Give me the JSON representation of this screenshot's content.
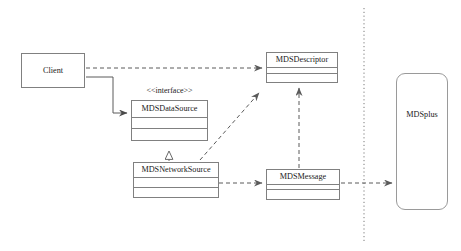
{
  "diagram": {
    "background_color": "#ffffff",
    "line_color": "#808080",
    "text_color": "#1a1a1a",
    "boundary_line_color": "#8a8a8a"
  },
  "nodes": {
    "client": {
      "label": "Client",
      "kind": "plain-box",
      "x": 21,
      "y": 53,
      "w": 64,
      "h": 35
    },
    "mds_data_source": {
      "label": "MDSDataSource",
      "stereotype": "<<interface>>",
      "kind": "uml-class",
      "x": 131,
      "y": 100,
      "w": 77,
      "h": 41,
      "stereotype_x": 131,
      "stereotype_y": 88,
      "stereotype_w": 77
    },
    "mds_network_source": {
      "label": "MDSNetworkSource",
      "kind": "uml-class",
      "x": 133,
      "y": 162,
      "w": 86,
      "h": 36
    },
    "mds_descriptor": {
      "label": "MDSDescriptor",
      "kind": "uml-class",
      "x": 266,
      "y": 52,
      "w": 72,
      "h": 31
    },
    "mds_message": {
      "label": "MDSMessage",
      "kind": "uml-class",
      "x": 266,
      "y": 169,
      "w": 74,
      "h": 31
    },
    "mdsplus": {
      "label": "MDSplus",
      "kind": "rounded-box",
      "x": 396,
      "y": 73,
      "w": 52,
      "h": 137,
      "label_y": 109
    }
  },
  "edges": [
    {
      "name": "client-to-mdsdescriptor",
      "from": "client",
      "to": "mds_descriptor",
      "style": "dashed",
      "arrow": "open",
      "label": ""
    },
    {
      "name": "client-to-mdsdatasource",
      "from": "client",
      "to": "mds_data_source",
      "style": "solid",
      "arrow": "filled",
      "label": ""
    },
    {
      "name": "mdsnetworksource-realizes-mdsdatasource",
      "from": "mds_network_source",
      "to": "mds_data_source",
      "style": "dashed",
      "arrow": "hollow-triangle",
      "label": ""
    },
    {
      "name": "mdsnetworksource-to-mdsdescriptor",
      "from": "mds_network_source",
      "to": "mds_descriptor",
      "style": "dashed",
      "arrow": "open",
      "label": ""
    },
    {
      "name": "mdsnetworksource-to-mdsmessage",
      "from": "mds_network_source",
      "to": "mds_message",
      "style": "dashed",
      "arrow": "open",
      "label": ""
    },
    {
      "name": "mdsmessage-to-mdsdescriptor",
      "from": "mds_message",
      "to": "mds_descriptor",
      "style": "dashed",
      "arrow": "open",
      "label": ""
    },
    {
      "name": "mdsmessage-to-mdsplus",
      "from": "mds_message",
      "to": "mdsplus",
      "style": "dashed",
      "arrow": "open",
      "label": ""
    }
  ],
  "boundary": {
    "name": "system-boundary",
    "style": "dotted-vertical",
    "x": 364,
    "y_top": 8,
    "y_bottom": 243
  }
}
